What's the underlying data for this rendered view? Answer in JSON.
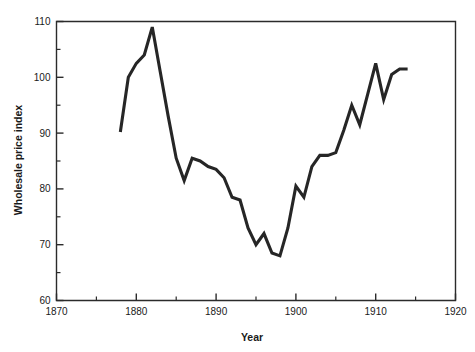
{
  "chart_data": {
    "type": "line",
    "title": "",
    "xlabel": "Year",
    "ylabel": "Wholesale price index",
    "xlim": [
      1870,
      1920
    ],
    "ylim": [
      60,
      110
    ],
    "grid": false,
    "legend": null,
    "x_major_ticks": [
      1870,
      1880,
      1890,
      1900,
      1910,
      1920
    ],
    "x_major_tick_labels": [
      "1870",
      "1880",
      "1890",
      "1900",
      "1910",
      "1920"
    ],
    "x_minor_ticks": [
      1875,
      1885,
      1895,
      1905,
      1915
    ],
    "y_major_ticks": [
      60,
      70,
      80,
      90,
      100,
      110
    ],
    "y_major_tick_labels": [
      "60",
      "70",
      "80",
      "90",
      "100",
      "110"
    ],
    "y_minor_ticks": [
      65,
      75,
      85,
      95,
      105
    ],
    "series": [
      {
        "name": "Wholesale price index",
        "color": "#262626",
        "x": [
          1878,
          1879,
          1880,
          1881,
          1882,
          1883,
          1884,
          1885,
          1886,
          1887,
          1888,
          1889,
          1890,
          1891,
          1892,
          1893,
          1894,
          1895,
          1896,
          1897,
          1898,
          1899,
          1900,
          1901,
          1902,
          1903,
          1904,
          1905,
          1906,
          1907,
          1908,
          1909,
          1910,
          1911,
          1912,
          1913,
          1914
        ],
        "y": [
          90.2,
          100.0,
          102.5,
          104.0,
          109.0,
          101.0,
          93.0,
          85.5,
          81.5,
          85.5,
          85.0,
          84.0,
          83.5,
          82.0,
          78.5,
          78.0,
          73.0,
          70.0,
          72.0,
          68.5,
          68.0,
          73.0,
          80.5,
          78.5,
          84.0,
          86.0,
          86.0,
          86.5,
          90.5,
          95.0,
          91.5,
          97.0,
          102.5,
          96.0,
          100.5,
          101.5,
          101.5
        ]
      }
    ]
  },
  "axis": {
    "x_title": "Year",
    "y_title": "Wholesale price index"
  },
  "colors": {
    "line": "#262626",
    "frame": "#2b2b2b",
    "background": "#ffffff"
  }
}
